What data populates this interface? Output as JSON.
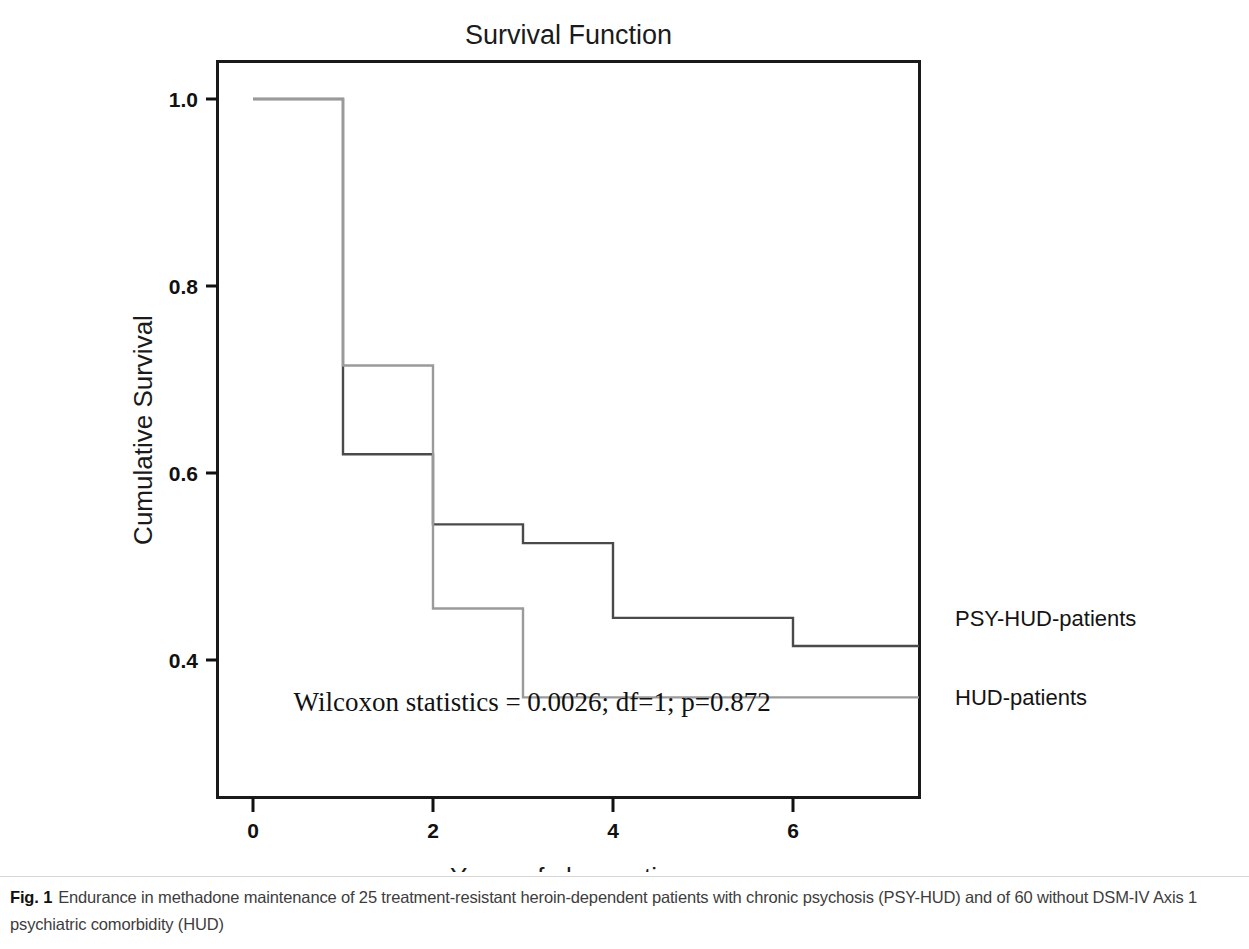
{
  "chart_data": {
    "type": "line",
    "title": "Survival Function",
    "xlabel": "Years of observation",
    "ylabel": "Cumulative Survival",
    "xlim": [
      -0.3,
      7.6
    ],
    "ylim": [
      0.31,
      1.04
    ],
    "xticks": [
      "0",
      "2",
      "4",
      "6"
    ],
    "xtick_values": [
      0,
      2,
      4,
      6
    ],
    "yticks": [
      "1.0",
      "0.8",
      "0.6",
      "0.4"
    ],
    "ytick_values": [
      1.0,
      0.8,
      0.6,
      0.4
    ],
    "grid": false,
    "legend_position": "right-inline",
    "step_type": "post",
    "series": [
      {
        "name": "PSY-HUD-patients",
        "color": "#4a4a4a",
        "x": [
          0,
          1,
          1,
          2,
          2,
          3,
          3,
          4,
          4,
          6,
          6,
          7.4
        ],
        "y": [
          1.0,
          1.0,
          0.62,
          0.62,
          0.545,
          0.545,
          0.525,
          0.525,
          0.445,
          0.445,
          0.415,
          0.415
        ],
        "label_x": 7.6,
        "label_y": 0.445
      },
      {
        "name": "HUD-patients",
        "color": "#9a9a9a",
        "x": [
          0,
          1,
          1,
          2,
          2,
          3,
          3,
          7.4
        ],
        "y": [
          1.0,
          1.0,
          0.715,
          0.715,
          0.455,
          0.455,
          0.36,
          0.36
        ],
        "label_x": 7.6,
        "label_y": 0.36
      }
    ],
    "annotations": [
      {
        "name": "wilcoxon-statistics",
        "text": "Wilcoxon statistics = 0.0026; df=1; p=0.872",
        "x": 0.45,
        "y": 0.345
      }
    ]
  },
  "caption": {
    "label": "Fig. 1",
    "text": "Endurance in methadone maintenance of 25 treatment-resistant heroin-dependent patients with chronic psychosis (PSY-HUD) and of 60 without DSM-IV Axis 1 psychiatric comorbidity (HUD)"
  }
}
